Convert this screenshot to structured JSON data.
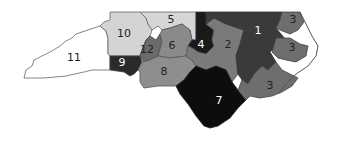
{
  "map": {
    "title": "",
    "districts": [
      {
        "id": "1",
        "label": "1",
        "fill": "#3a3a3a",
        "label_color": "#ffffff",
        "lx": 258,
        "ly": 31
      },
      {
        "id": "2",
        "label": "2",
        "fill": "#7a7a7a",
        "label_color": "#222222",
        "lx": 228,
        "ly": 45
      },
      {
        "id": "3",
        "label": "3",
        "fill": "#6e6e6e",
        "label_color": "#222222",
        "lx": 293,
        "ly": 20
      },
      {
        "id": "3b",
        "label": "3",
        "fill": "#6e6e6e",
        "label_color": "#222222",
        "lx": 292,
        "ly": 48
      },
      {
        "id": "3c",
        "label": "3",
        "fill": "#6e6e6e",
        "label_color": "#222222",
        "lx": 270,
        "ly": 86
      },
      {
        "id": "4",
        "label": "4",
        "fill": "#1a1a1a",
        "label_color": "#ffffff",
        "lx": 201,
        "ly": 45
      },
      {
        "id": "5",
        "label": "5",
        "fill": "#d6d6d6",
        "label_color": "#222222",
        "lx": 171,
        "ly": 20
      },
      {
        "id": "6",
        "label": "6",
        "fill": "#8a8a8a",
        "label_color": "#222222",
        "lx": 172,
        "ly": 46
      },
      {
        "id": "7",
        "label": "7",
        "fill": "#0d0d0d",
        "label_color": "#ffffff",
        "lx": 219,
        "ly": 101
      },
      {
        "id": "8",
        "label": "8",
        "fill": "#8e8e8e",
        "label_color": "#222222",
        "lx": 164,
        "ly": 72
      },
      {
        "id": "9",
        "label": "9",
        "fill": "#2a2a2a",
        "label_color": "#ffffff",
        "lx": 122,
        "ly": 63
      },
      {
        "id": "10",
        "label": "10",
        "fill": "#d4d4d4",
        "label_color": "#222222",
        "lx": 124,
        "ly": 34
      },
      {
        "id": "11",
        "label": "11",
        "fill": "#ffffff",
        "label_color": "#222222",
        "lx": 74,
        "ly": 58
      },
      {
        "id": "12",
        "label": "12",
        "fill": "#6a6a6a",
        "label_color": "#222222",
        "lx": 147,
        "ly": 50
      }
    ]
  }
}
